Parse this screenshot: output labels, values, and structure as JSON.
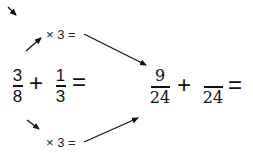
{
  "diagram": {
    "top_multiplier": "× 3 =",
    "bottom_multiplier": "× 3 =",
    "left_equation": {
      "fraction1": {
        "numerator": "3",
        "denominator": "8"
      },
      "operator": "+",
      "fraction2": {
        "numerator": "1",
        "denominator": "3"
      },
      "equals": "="
    },
    "right_equation": {
      "fraction1": {
        "numerator": "9",
        "denominator": "24"
      },
      "operator": "+",
      "fraction2": {
        "numerator": "",
        "denominator": "24"
      },
      "equals": "="
    },
    "colors": {
      "ink": "#111111",
      "background": "#ffffff"
    }
  }
}
